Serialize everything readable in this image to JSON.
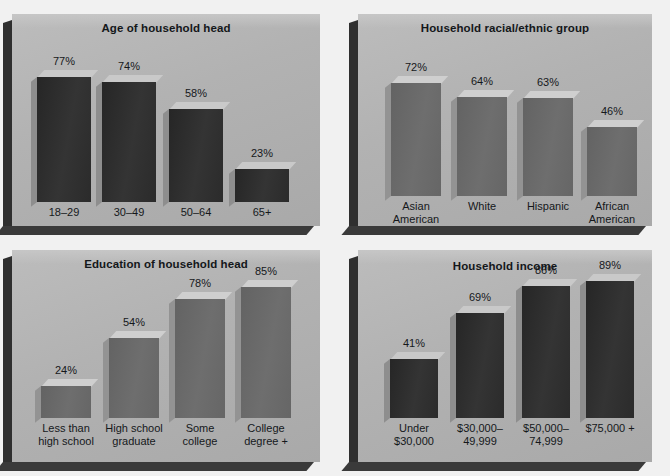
{
  "figure": {
    "panel_bg": "#b2b2b2",
    "page_bg": "#f1f1f1",
    "bar_dark": "#2e2e2e",
    "bar_mid": "#6b6b6b"
  },
  "charts": [
    {
      "id": "age",
      "title": "Age of household head",
      "type": "bar",
      "bar_style": "dark",
      "ylabel": "",
      "xlabel": "",
      "ylim": [
        0,
        100
      ],
      "categories": [
        "18–29",
        "30–49",
        "50–64",
        "65+"
      ],
      "values": [
        77,
        74,
        58,
        23
      ],
      "value_labels": [
        "77%",
        "74%",
        "58%",
        "23%"
      ]
    },
    {
      "id": "race",
      "title": "Household racial/ethnic group",
      "type": "bar",
      "bar_style": "mid",
      "ylabel": "",
      "xlabel": "",
      "ylim": [
        0,
        100
      ],
      "categories": [
        "Asian\nAmerican",
        "White",
        "Hispanic",
        "African\nAmerican"
      ],
      "values": [
        72,
        64,
        63,
        46
      ],
      "value_labels": [
        "72%",
        "64%",
        "63%",
        "46%"
      ]
    },
    {
      "id": "education",
      "title": "Education of household head",
      "type": "bar",
      "bar_style": "mid",
      "ylabel": "",
      "xlabel": "",
      "ylim": [
        0,
        100
      ],
      "categories": [
        "Less than\nhigh school",
        "High school\ngraduate",
        "Some\ncollege",
        "College\ndegree +"
      ],
      "values": [
        24,
        54,
        78,
        85
      ],
      "value_labels": [
        "24%",
        "54%",
        "78%",
        "85%"
      ]
    },
    {
      "id": "income",
      "title": "Household income",
      "type": "bar",
      "bar_style": "dark",
      "ylabel": "",
      "xlabel": "",
      "ylim": [
        0,
        100
      ],
      "categories": [
        "Under\n$30,000",
        "$30,000–\n49,999",
        "$50,000–\n74,999",
        "$75,000 +"
      ],
      "values": [
        41,
        69,
        86,
        89
      ],
      "value_labels": [
        "41%",
        "69%",
        "86%",
        "89%"
      ]
    }
  ],
  "chart_data": [
    {
      "type": "bar",
      "title": "Age of household head",
      "categories": [
        "18-29",
        "30-49",
        "50-64",
        "65+"
      ],
      "values": [
        77,
        74,
        58,
        23
      ],
      "xlabel": "",
      "ylabel": "Percent",
      "ylim": [
        0,
        100
      ],
      "grid": false,
      "legend": "none"
    },
    {
      "type": "bar",
      "title": "Household racial/ethnic group",
      "categories": [
        "Asian American",
        "White",
        "Hispanic",
        "African American"
      ],
      "values": [
        72,
        64,
        63,
        46
      ],
      "xlabel": "",
      "ylabel": "Percent",
      "ylim": [
        0,
        100
      ],
      "grid": false,
      "legend": "none"
    },
    {
      "type": "bar",
      "title": "Education of household head",
      "categories": [
        "Less than high school",
        "High school graduate",
        "Some college",
        "College degree +"
      ],
      "values": [
        24,
        54,
        78,
        85
      ],
      "xlabel": "",
      "ylabel": "Percent",
      "ylim": [
        0,
        100
      ],
      "grid": false,
      "legend": "none"
    },
    {
      "type": "bar",
      "title": "Household income",
      "categories": [
        "Under $30,000",
        "$30,000-49,999",
        "$50,000-74,999",
        "$75,000 +"
      ],
      "values": [
        41,
        69,
        86,
        89
      ],
      "xlabel": "",
      "ylabel": "Percent",
      "ylim": [
        0,
        100
      ],
      "grid": false,
      "legend": "none"
    }
  ]
}
